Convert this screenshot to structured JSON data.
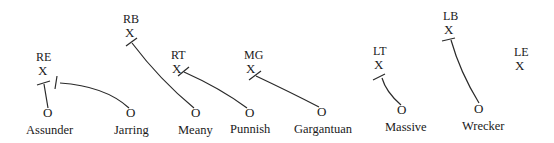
{
  "diagram": {
    "type": "football-blocking-assignments",
    "defenders": [
      {
        "id": "RE",
        "label": "RE",
        "mark": "X",
        "x": 36,
        "y": 58
      },
      {
        "id": "RB",
        "label": "RB",
        "mark": "X",
        "x": 124,
        "y": 20
      },
      {
        "id": "RT",
        "label": "RT",
        "mark": "X",
        "x": 173,
        "y": 56
      },
      {
        "id": "MG",
        "label": "MG",
        "mark": "X",
        "x": 245,
        "y": 56
      },
      {
        "id": "LT",
        "label": "LT",
        "mark": "X",
        "x": 373,
        "y": 54
      },
      {
        "id": "LB",
        "label": "LB",
        "mark": "X",
        "x": 443,
        "y": 18
      },
      {
        "id": "LE",
        "label": "LE",
        "mark": "X",
        "x": 515,
        "y": 54
      }
    ],
    "blockers": [
      {
        "name": "Assunder",
        "mark": "O",
        "x": 48,
        "y": 117,
        "blocks": "RE"
      },
      {
        "name": "Jarring",
        "mark": "O",
        "x": 131,
        "y": 117,
        "blocks": "RE"
      },
      {
        "name": "Meany",
        "mark": "O",
        "x": 196,
        "y": 117,
        "blocks": "RB"
      },
      {
        "name": "Punnish",
        "mark": "O",
        "x": 250,
        "y": 117,
        "blocks": "RT"
      },
      {
        "name": "Gargantuan",
        "mark": "O",
        "x": 322,
        "y": 116,
        "blocks": "MG"
      },
      {
        "name": "Massive",
        "mark": "O",
        "x": 402,
        "y": 114,
        "blocks": "LT"
      },
      {
        "name": "Wrecker",
        "mark": "O",
        "x": 478,
        "y": 113,
        "blocks": "LB"
      }
    ]
  }
}
